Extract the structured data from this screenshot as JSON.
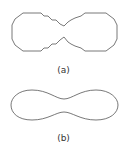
{
  "figures": [
    {
      "id": "a",
      "label": "(a)",
      "description": "polygonal dumbbell outline with jagged stepped edges"
    },
    {
      "id": "b",
      "label": "(b)",
      "description": "smooth dumbbell / peanut outline"
    }
  ],
  "colors": {
    "stroke": "#555555",
    "background": "#ffffff"
  }
}
